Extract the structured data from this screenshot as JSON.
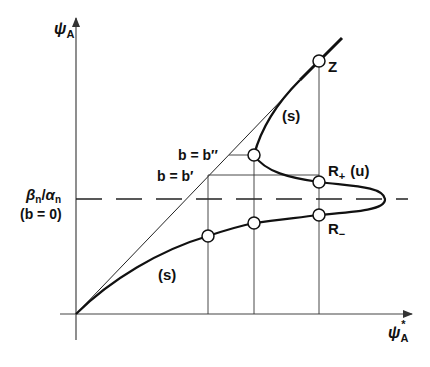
{
  "diagram": {
    "y_axis_label": "ψ",
    "y_axis_sub": "A",
    "x_axis_label": "ψ",
    "x_axis_sub": "A",
    "x_axis_sup": "*",
    "level_label_line1_a": "β",
    "level_label_line1_a_sub": "n",
    "level_label_line1_slash": "/",
    "level_label_line1_b": "α",
    "level_label_line1_b_sub": "n",
    "level_label_line2": "(b = 0)",
    "b_double_prime_label": "b = b′′",
    "b_prime_label": "b = b′",
    "point_z": "Z",
    "point_r_plus": "R",
    "point_r_plus_sub": "+",
    "point_r_plus_note": "(u)",
    "point_r_minus": "R",
    "point_r_minus_sub": "−",
    "stable_upper": "(s)",
    "stable_lower": "(s)",
    "colors": {
      "ink": "#111111",
      "background": "#ffffff"
    }
  }
}
